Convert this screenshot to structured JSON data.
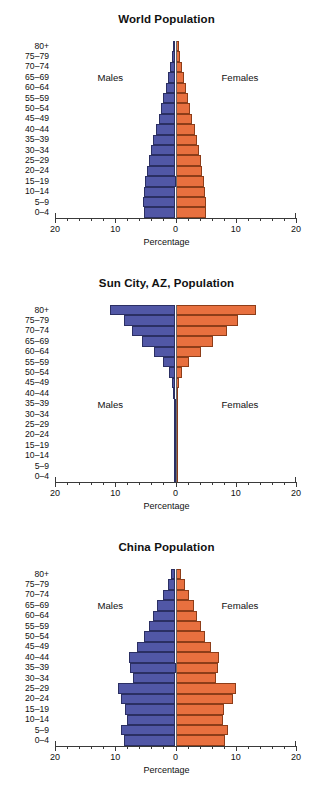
{
  "figure": {
    "axis_title": "Percentage",
    "male_label": "Males",
    "female_label": "Females",
    "tick_labels": [
      "20",
      "10",
      "0",
      "10",
      "20"
    ],
    "colors": {
      "male": "#5157a6",
      "female": "#e8703f",
      "male_edge": "#2b2f63",
      "female_edge": "#8d3d19",
      "axis": "#3a3a3a",
      "text": "#111111"
    },
    "age_groups": [
      "80+",
      "75–79",
      "70–74",
      "65–69",
      "60–64",
      "55–59",
      "50–54",
      "45–49",
      "40–44",
      "35–39",
      "30–34",
      "25–29",
      "20–24",
      "15–19",
      "10–14",
      "5–9",
      "0–4"
    ]
  },
  "chart_data": [
    {
      "type": "bar",
      "title": "World Population",
      "xlabel": "Percentage",
      "ylabel": "",
      "xlim": [
        -20,
        20
      ],
      "xticks": [
        -20,
        -10,
        0,
        10,
        20
      ],
      "xticklabels": [
        "20",
        "10",
        "0",
        "10",
        "20"
      ],
      "grid": false,
      "legend_position": "inside",
      "categories": [
        "80+",
        "75–79",
        "70–74",
        "65–69",
        "60–64",
        "55–59",
        "50–54",
        "45–49",
        "40–44",
        "35–39",
        "30–34",
        "25–29",
        "20–24",
        "15–19",
        "10–14",
        "5–9",
        "0–4"
      ],
      "series": [
        {
          "name": "Males",
          "values": [
            0.4,
            0.6,
            0.9,
            1.2,
            1.6,
            2.0,
            2.4,
            2.8,
            3.3,
            3.7,
            4.1,
            4.4,
            4.7,
            5.0,
            5.3,
            5.4,
            5.3
          ]
        },
        {
          "name": "Females",
          "values": [
            0.5,
            0.8,
            1.1,
            1.4,
            1.8,
            2.1,
            2.4,
            2.8,
            3.2,
            3.5,
            3.9,
            4.2,
            4.4,
            4.7,
            4.9,
            5.0,
            5.0
          ]
        }
      ]
    },
    {
      "type": "bar",
      "title": "Sun City, AZ, Population",
      "xlabel": "Percentage",
      "ylabel": "",
      "xlim": [
        -20,
        20
      ],
      "xticks": [
        -20,
        -10,
        0,
        10,
        20
      ],
      "xticklabels": [
        "20",
        "10",
        "0",
        "10",
        "20"
      ],
      "grid": false,
      "legend_position": "inside",
      "categories": [
        "80+",
        "75–79",
        "70–74",
        "65–69",
        "60–64",
        "55–59",
        "50–54",
        "45–49",
        "40–44",
        "35–39",
        "30–34",
        "25–29",
        "20–24",
        "15–19",
        "10–14",
        "5–9",
        "0–4"
      ],
      "series": [
        {
          "name": "Males",
          "values": [
            10.8,
            8.5,
            7.3,
            5.5,
            3.6,
            2.0,
            1.0,
            0.5,
            0.35,
            0.3,
            0.3,
            0.25,
            0.25,
            0.25,
            0.2,
            0.2,
            0.2
          ]
        },
        {
          "name": "Females",
          "values": [
            13.4,
            10.3,
            8.6,
            6.2,
            4.2,
            2.3,
            1.1,
            0.5,
            0.4,
            0.3,
            0.3,
            0.25,
            0.25,
            0.25,
            0.2,
            0.2,
            0.2
          ]
        }
      ]
    },
    {
      "type": "bar",
      "title": "China Population",
      "xlabel": "Percentage",
      "ylabel": "",
      "xlim": [
        -20,
        20
      ],
      "xticks": [
        -20,
        -10,
        0,
        10,
        20
      ],
      "xticklabels": [
        "20",
        "10",
        "0",
        "10",
        "20"
      ],
      "grid": false,
      "legend_position": "inside",
      "categories": [
        "80+",
        "75–79",
        "70–74",
        "65–69",
        "60–64",
        "55–59",
        "50–54",
        "45–49",
        "40–44",
        "35–39",
        "30–34",
        "25–29",
        "20–24",
        "15–19",
        "10–14",
        "5–9",
        "0–4"
      ],
      "series": [
        {
          "name": "Males",
          "values": [
            0.7,
            1.3,
            2.1,
            3.0,
            3.7,
            4.4,
            5.3,
            6.4,
            7.7,
            7.5,
            7.1,
            9.6,
            9.0,
            8.3,
            8.1,
            9.0,
            8.6
          ]
        },
        {
          "name": "Females",
          "values": [
            0.9,
            1.5,
            2.2,
            3.0,
            3.6,
            4.2,
            4.9,
            5.9,
            7.2,
            7.1,
            6.8,
            10.0,
            9.5,
            8.1,
            7.9,
            8.7,
            8.2
          ]
        }
      ]
    }
  ]
}
